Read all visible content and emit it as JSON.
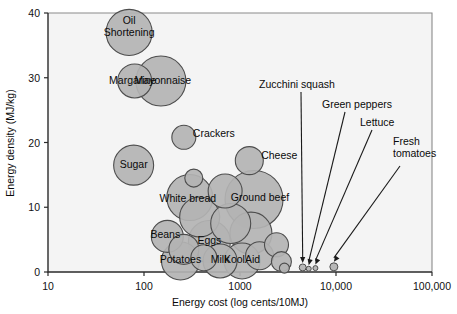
{
  "chart_data": {
    "type": "scatter",
    "title": "",
    "xlabel": "Energy cost (log cents/10MJ)",
    "ylabel": "Energy density (MJ/kg)",
    "xscale": "log",
    "xlim": [
      10,
      100000
    ],
    "ylim": [
      0,
      40
    ],
    "xticks": [
      "10",
      "100",
      "1000",
      "10,000",
      "100,000"
    ],
    "yticks": [
      "0",
      "10",
      "20",
      "30",
      "40"
    ],
    "grid": false,
    "legend": "none",
    "size_encoding": "bubble area",
    "points": [
      {
        "label": "Oil\nShortening",
        "label_line1": "Oil",
        "label_line2": "Shortening",
        "x": 70,
        "y": 37,
        "r": 23,
        "label_dx": 0,
        "label_dy": -4
      },
      {
        "label": "Margarine",
        "x": 80,
        "y": 29.5,
        "r": 17,
        "label_dx": -2,
        "label_dy": 3
      },
      {
        "label": "Mayonnaise",
        "x": 150,
        "y": 29.5,
        "r": 25,
        "label_dx": 2,
        "label_dy": 3
      },
      {
        "label": "Crackers",
        "x": 260,
        "y": 20.8,
        "r": 12,
        "label_dx": 30,
        "label_dy": 0
      },
      {
        "label": "Sugar",
        "x": 78,
        "y": 16.5,
        "r": 20,
        "label_dx": 0,
        "label_dy": 3
      },
      {
        "label": "Cheese",
        "x": 1250,
        "y": 17.2,
        "r": 14,
        "label_dx": 30,
        "label_dy": -2
      },
      {
        "label": "White bread",
        "x": 300,
        "y": 11.5,
        "r": 23,
        "label_dx": -2,
        "label_dy": 4
      },
      {
        "label": "Ground beef",
        "x": 1400,
        "y": 11.2,
        "r": 29,
        "label_dx": 6,
        "label_dy": 2
      },
      {
        "label": "Beans",
        "x": 175,
        "y": 5.5,
        "r": 16,
        "label_dx": -2,
        "label_dy": 2
      },
      {
        "label": "Eggs",
        "x": 480,
        "y": 4.7,
        "r": 21,
        "label_dx": 0,
        "label_dy": 2
      },
      {
        "label": "Potatoes",
        "x": 240,
        "y": 1.7,
        "r": 19,
        "label_dx": 0,
        "label_dy": 2
      },
      {
        "label": "Milk",
        "x": 620,
        "y": 1.7,
        "r": 17,
        "label_dx": 0,
        "label_dy": 2
      },
      {
        "label": "KoolAid",
        "x": 1050,
        "y": 1.7,
        "r": 18,
        "label_dx": 0,
        "label_dy": 2
      },
      {
        "label": "",
        "x": 330,
        "y": 14.5,
        "r": 9
      },
      {
        "label": "",
        "x": 700,
        "y": 12.5,
        "r": 17
      },
      {
        "label": "",
        "x": 380,
        "y": 8.5,
        "r": 20
      },
      {
        "label": "",
        "x": 800,
        "y": 7.5,
        "r": 20
      },
      {
        "label": "",
        "x": 1300,
        "y": 6.0,
        "r": 21
      },
      {
        "label": "",
        "x": 260,
        "y": 3.5,
        "r": 15
      },
      {
        "label": "",
        "x": 420,
        "y": 2.2,
        "r": 13
      },
      {
        "label": "",
        "x": 1600,
        "y": 2.5,
        "r": 14
      },
      {
        "label": "",
        "x": 2400,
        "y": 4.2,
        "r": 12
      },
      {
        "label": "",
        "x": 2700,
        "y": 1.6,
        "r": 10
      },
      {
        "label": "",
        "x": 2900,
        "y": 0.6,
        "r": 5
      }
    ],
    "callouts": [
      {
        "label": "Zucchini squash",
        "x": 4500,
        "y": 0.7,
        "r": 3.5
      },
      {
        "label": "Green peppers",
        "x": 5200,
        "y": 0.5,
        "r": 2.5
      },
      {
        "label": "Lettuce",
        "x": 6100,
        "y": 0.6,
        "r": 2.5
      },
      {
        "label": "Fresh tomatoes",
        "label_line1": "Fresh",
        "label_line2": "tomatoes",
        "x": 9500,
        "y": 0.8,
        "r": 4
      }
    ]
  },
  "axes": {
    "x_title": "Energy cost (log cents/10MJ)",
    "y_title": "Energy density (MJ/kg)",
    "x_tick_labels": [
      "10",
      "100",
      "1000",
      "10,000",
      "100,000"
    ],
    "y_tick_labels": [
      "0",
      "10",
      "20",
      "30",
      "40"
    ]
  },
  "colors": {
    "bubble_fill": "#b3b3b3",
    "bubble_stroke": "#4d4d4d",
    "axis": "#2b2b2b",
    "plot_bg": "#f4f4f4",
    "page_bg": "#ffffff",
    "text": "#0a0a0a"
  }
}
